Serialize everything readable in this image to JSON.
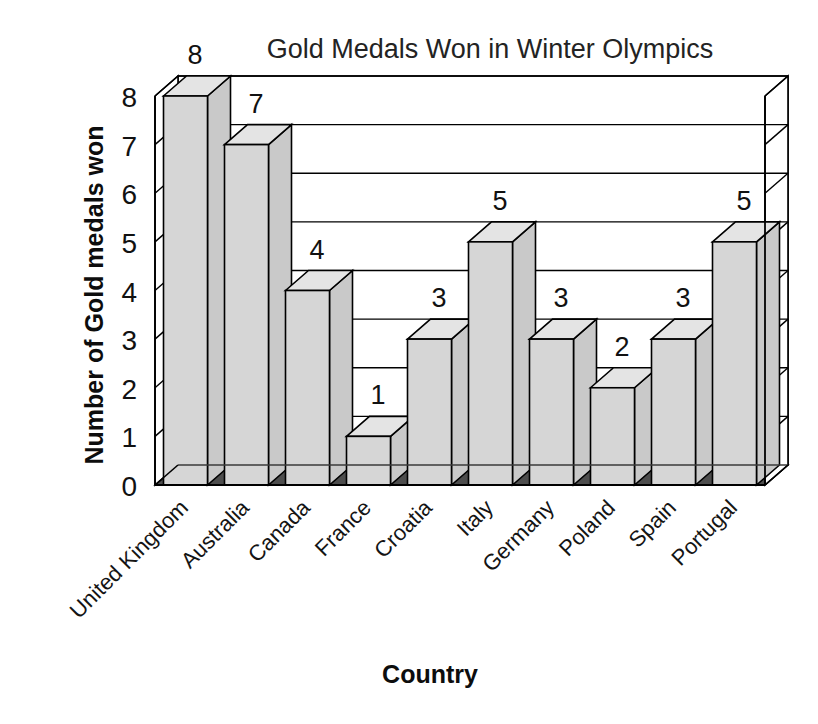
{
  "chart_data": {
    "type": "bar",
    "title": "Gold Medals Won in Winter Olympics",
    "xlabel": "Country",
    "ylabel": "Number of Gold medals won",
    "categories": [
      "United Kingdom",
      "Australia",
      "Canada",
      "France",
      "Croatia",
      "Italy",
      "Germany",
      "Poland",
      "Spain",
      "Portugal"
    ],
    "values": [
      8,
      7,
      4,
      1,
      3,
      5,
      3,
      2,
      3,
      5
    ],
    "data_labels": [
      "8",
      "7",
      "4",
      "1",
      "3",
      "5",
      "3",
      "2",
      "3",
      "5"
    ],
    "ylim": [
      0,
      8
    ],
    "yticks": [
      0,
      1,
      2,
      3,
      4,
      5,
      6,
      7,
      8
    ],
    "ytick_labels": [
      "0",
      "1",
      "2",
      "3",
      "4",
      "5",
      "6",
      "7",
      "8"
    ],
    "grid": true,
    "legend": false,
    "style": "3d-columns",
    "colors": {
      "bar_front": "#d6d6d6",
      "bar_side": "#c9c9c9",
      "bar_top": "#e4e4e4",
      "bar_outline": "#000000",
      "floor": "#4d4d4d",
      "floor_edge": "#3a3a3a",
      "plot_background": "#ffffff",
      "axis": "#000000",
      "text": "#111111"
    }
  }
}
